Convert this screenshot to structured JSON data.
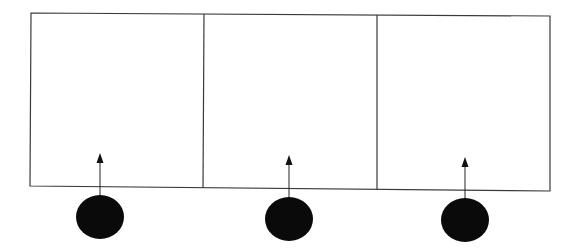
{
  "diagram": {
    "title": "",
    "background": "#ffffff",
    "stroke_color": "#3a3a3a",
    "fill_color": "#0a0a0a",
    "container": {
      "corners": {
        "tl": [
          31,
          13
        ],
        "tr": [
          550,
          16
        ],
        "br": [
          550,
          191
        ],
        "bl": [
          30,
          186
        ]
      }
    },
    "dividers": [
      {
        "top": [
          204,
          14
        ],
        "bottom": [
          203,
          188
        ]
      },
      {
        "top": [
          377,
          15
        ],
        "bottom": [
          377,
          190
        ]
      }
    ],
    "panels": [
      {
        "label": "",
        "arrow": {
          "x": 100,
          "tip_y": 153,
          "base_y": 196
        },
        "node": {
          "cx": 100,
          "cy": 217,
          "rx": 24,
          "ry": 22
        }
      },
      {
        "label": "",
        "arrow": {
          "x": 289,
          "tip_y": 155,
          "base_y": 198
        },
        "node": {
          "cx": 289,
          "cy": 219,
          "rx": 24,
          "ry": 22
        }
      },
      {
        "label": "",
        "arrow": {
          "x": 465,
          "tip_y": 157,
          "base_y": 199
        },
        "node": {
          "cx": 465,
          "cy": 220,
          "rx": 24,
          "ry": 22
        }
      }
    ]
  }
}
